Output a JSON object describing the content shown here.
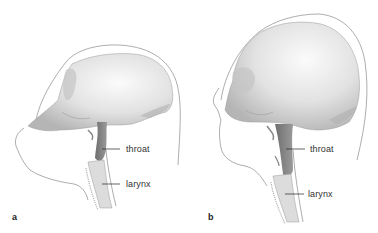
{
  "figure": {
    "panels": [
      {
        "id": "a",
        "letter": "a",
        "labels": {
          "throat": "throat",
          "larynx": "larynx"
        }
      },
      {
        "id": "b",
        "letter": "b",
        "labels": {
          "throat": "throat",
          "larynx": "larynx"
        }
      }
    ],
    "colors": {
      "background": "#ffffff",
      "skull_light": "#f2f2f2",
      "skull_mid": "#d4d4d4",
      "skull_shadow": "#a8a8a8",
      "throat_fill": "#7a7a7a",
      "outline": "#8a8a8a",
      "label_text": "#333333"
    }
  }
}
